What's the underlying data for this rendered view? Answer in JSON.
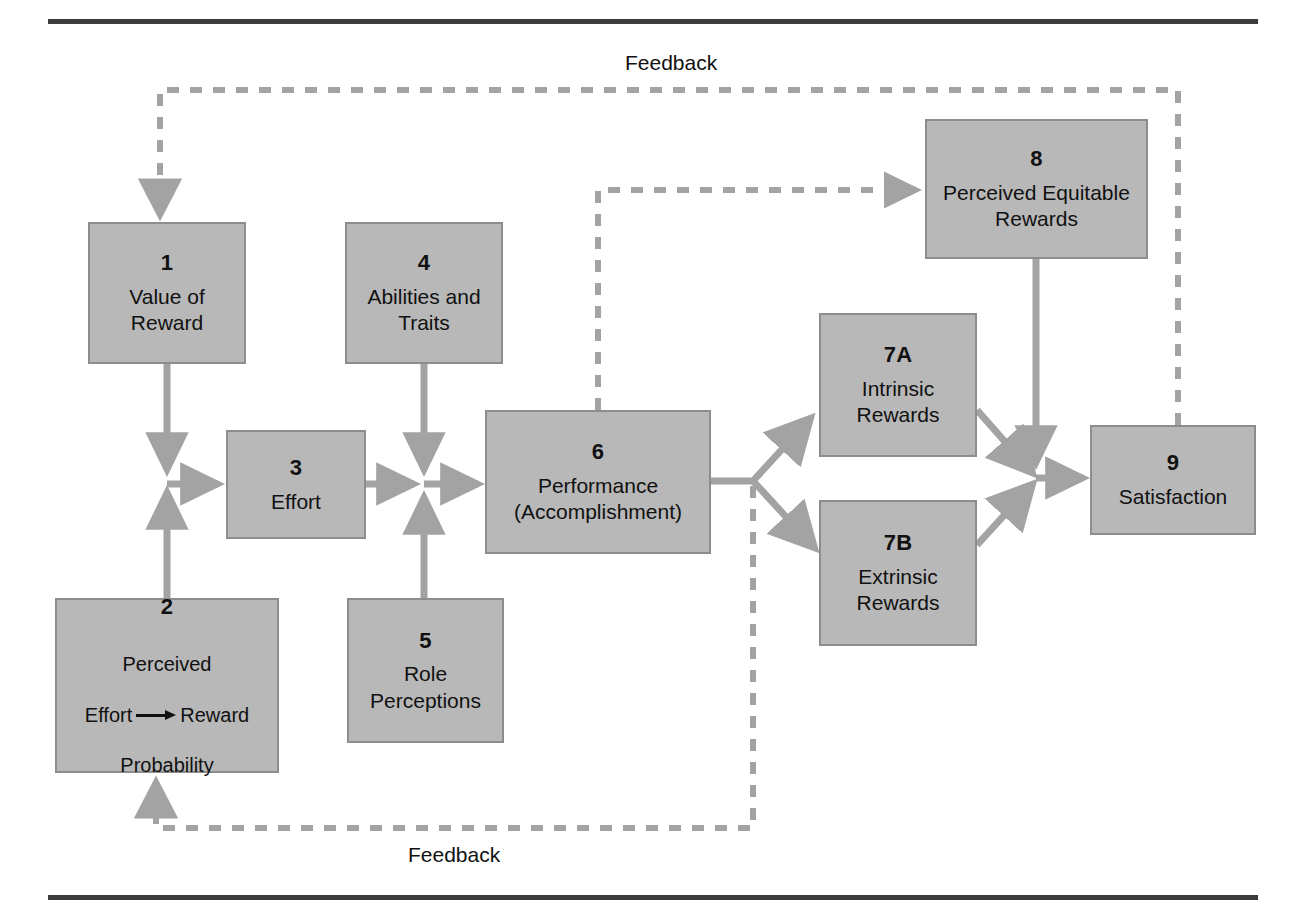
{
  "diagram": {
    "colors": {
      "box_fill": "#b8b8b8",
      "box_border": "#8d8d8d",
      "connector": "#a3a3a3",
      "rule": "#3c3c3c",
      "text": "#111111"
    },
    "rules": {
      "top": "horizontal-rule",
      "bottom": "horizontal-rule"
    },
    "nodes": [
      {
        "id": "1",
        "number": "1",
        "label": "Value of\nReward"
      },
      {
        "id": "2",
        "number": "2",
        "label_line1": "Perceived",
        "label_mid_left": "Effort",
        "label_mid_right": "Reward",
        "label_line3": "Probability"
      },
      {
        "id": "3",
        "number": "3",
        "label": "Effort"
      },
      {
        "id": "4",
        "number": "4",
        "label": "Abilities and\nTraits"
      },
      {
        "id": "5",
        "number": "5",
        "label": "Role\nPerceptions"
      },
      {
        "id": "6",
        "number": "6",
        "label": "Performance\n(Accomplishment)"
      },
      {
        "id": "7a",
        "number": "7A",
        "label": "Intrinsic\nRewards"
      },
      {
        "id": "7b",
        "number": "7B",
        "label": "Extrinsic\nRewards"
      },
      {
        "id": "8",
        "number": "8",
        "label": "Perceived Equitable\nRewards"
      },
      {
        "id": "9",
        "number": "9",
        "label": "Satisfaction"
      }
    ],
    "feedback_labels": {
      "top": "Feedback",
      "bottom": "Feedback"
    },
    "connections": [
      {
        "from": "1",
        "to": "effort-junction",
        "style": "solid"
      },
      {
        "from": "2",
        "to": "effort-junction",
        "style": "solid"
      },
      {
        "from": "3",
        "to": "performance-junction",
        "style": "solid"
      },
      {
        "from": "4",
        "to": "performance-junction",
        "style": "solid"
      },
      {
        "from": "5",
        "to": "performance-junction",
        "style": "solid"
      },
      {
        "from": "performance-junction",
        "to": "6",
        "style": "solid"
      },
      {
        "from": "6",
        "to": "7a",
        "style": "solid"
      },
      {
        "from": "6",
        "to": "7b",
        "style": "solid"
      },
      {
        "from": "6",
        "to": "8",
        "style": "dashed"
      },
      {
        "from": "7a",
        "to": "9",
        "style": "solid"
      },
      {
        "from": "7b",
        "to": "9",
        "style": "solid"
      },
      {
        "from": "8",
        "to": "9",
        "style": "solid"
      },
      {
        "from": "9",
        "to": "1",
        "style": "dashed",
        "label": "Feedback"
      },
      {
        "from": "6",
        "to": "2",
        "style": "dashed",
        "label": "Feedback"
      }
    ]
  }
}
